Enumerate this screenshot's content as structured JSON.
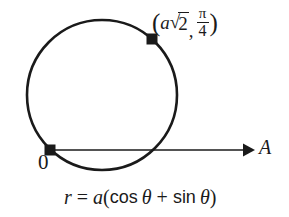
{
  "figure": {
    "type": "polar-curve-diagram",
    "background_color": "#ffffff",
    "stroke_color": "#1a1a1a",
    "curve": {
      "name": "circle",
      "equation_text": "r = a(cos θ + sin θ)",
      "center_x": 102,
      "center_y": 95,
      "radius": 75
    },
    "axis": {
      "name": "polar-axis",
      "label": "A",
      "y": 150,
      "x_start": 50,
      "x_end": 248
    },
    "origin": {
      "label": "0",
      "x": 50,
      "y": 150
    },
    "marked_point": {
      "x": 152,
      "y": 39,
      "label_parts": {
        "open_paren": "(",
        "coefficient": "a",
        "radical_sign": "√",
        "radicand": "2",
        "comma": ",",
        "angle_numerator": "π",
        "angle_denominator": "4",
        "close_paren": ")"
      },
      "label_plain": "(a√2, π/4)"
    },
    "equation_parts": {
      "r": "r",
      "equals": "=",
      "a": "a",
      "open_paren": "(",
      "cos": "cos",
      "theta1": "θ",
      "plus": "+",
      "sin": "sin",
      "theta2": "θ",
      "close_paren": ")"
    }
  }
}
